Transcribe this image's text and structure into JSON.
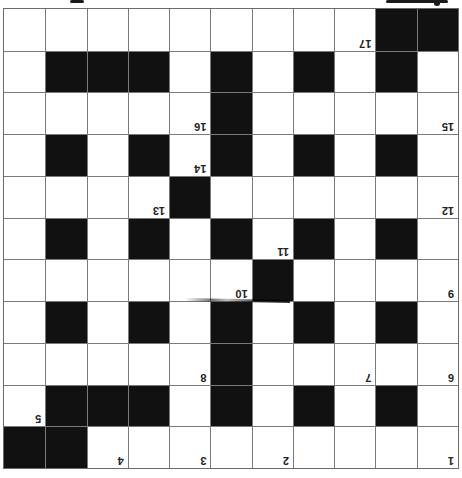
{
  "puzzle": {
    "orientation": "rotated-180",
    "rows": 11,
    "cols": 11,
    "colors": {
      "black_cell": "#111111",
      "white_cell": "#ffffff",
      "grid_line": "#7a7a7a",
      "number": "#222222"
    },
    "grid": [
      ".........##",
      ".#.#.#.###.",
      ".....#.....",
      ".#.#.#.#.#.",
      "....#......",
      ".#.#.#.#.#.",
      "......#....",
      ".#.#.#.#.#.",
      ".....#.....",
      ".#.#.#.###.",
      "##........."
    ],
    "numbers": [
      {
        "label": "1",
        "row": 0,
        "col": 0
      },
      {
        "label": "2",
        "row": 0,
        "col": 4
      },
      {
        "label": "3",
        "row": 0,
        "col": 6
      },
      {
        "label": "4",
        "row": 0,
        "col": 8
      },
      {
        "label": "5",
        "row": 1,
        "col": 10
      },
      {
        "label": "6",
        "row": 2,
        "col": 0
      },
      {
        "label": "7",
        "row": 2,
        "col": 2
      },
      {
        "label": "8",
        "row": 2,
        "col": 6
      },
      {
        "label": "9",
        "row": 4,
        "col": 0
      },
      {
        "label": "10",
        "row": 4,
        "col": 5
      },
      {
        "label": "11",
        "row": 5,
        "col": 4
      },
      {
        "label": "12",
        "row": 6,
        "col": 0
      },
      {
        "label": "13",
        "row": 6,
        "col": 7
      },
      {
        "label": "14",
        "row": 7,
        "col": 6
      },
      {
        "label": "15",
        "row": 8,
        "col": 0
      },
      {
        "label": "16",
        "row": 8,
        "col": 6
      },
      {
        "label": "17",
        "row": 10,
        "col": 2
      }
    ]
  }
}
